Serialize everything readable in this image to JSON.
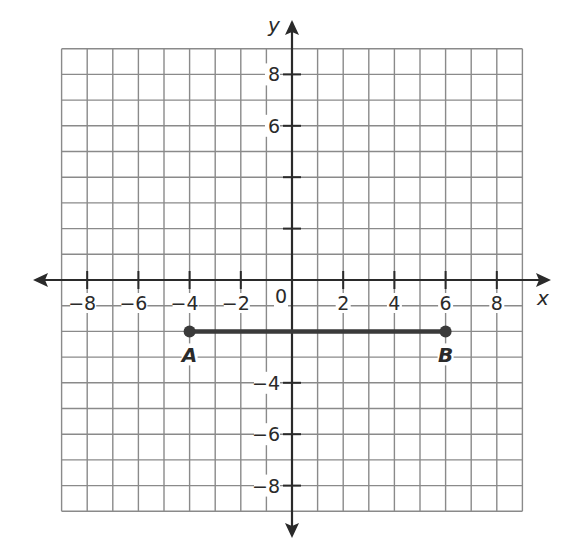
{
  "chart_data": {
    "type": "scatter",
    "title": "",
    "xlabel": "x",
    "ylabel": "y",
    "xlim": [
      -9,
      9
    ],
    "ylim": [
      -9,
      9
    ],
    "grid": true,
    "grid_step": 1,
    "x_ticks": [
      -8,
      -6,
      -4,
      -2,
      2,
      4,
      6,
      8
    ],
    "x_tick_labels": [
      "−8",
      "−6",
      "−4",
      "−2",
      "2",
      "4",
      "6",
      "8"
    ],
    "y_ticks": [
      8,
      6,
      4,
      2,
      -2,
      -4,
      -6,
      -8
    ],
    "y_tick_labels": [
      "8",
      "6",
      "",
      "",
      "",
      "−4",
      "−6",
      "−8"
    ],
    "origin_label": "0",
    "points": [
      {
        "name": "A",
        "x": -4,
        "y": -2
      },
      {
        "name": "B",
        "x": 6,
        "y": -2
      }
    ],
    "segments": [
      {
        "name": "AB",
        "from": "A",
        "to": "B"
      }
    ],
    "legend": null
  },
  "colors": {
    "grid": "#8a8a8a",
    "axis": "#2a2a2a",
    "segment": "#3a3a3a",
    "background": "#ffffff"
  }
}
